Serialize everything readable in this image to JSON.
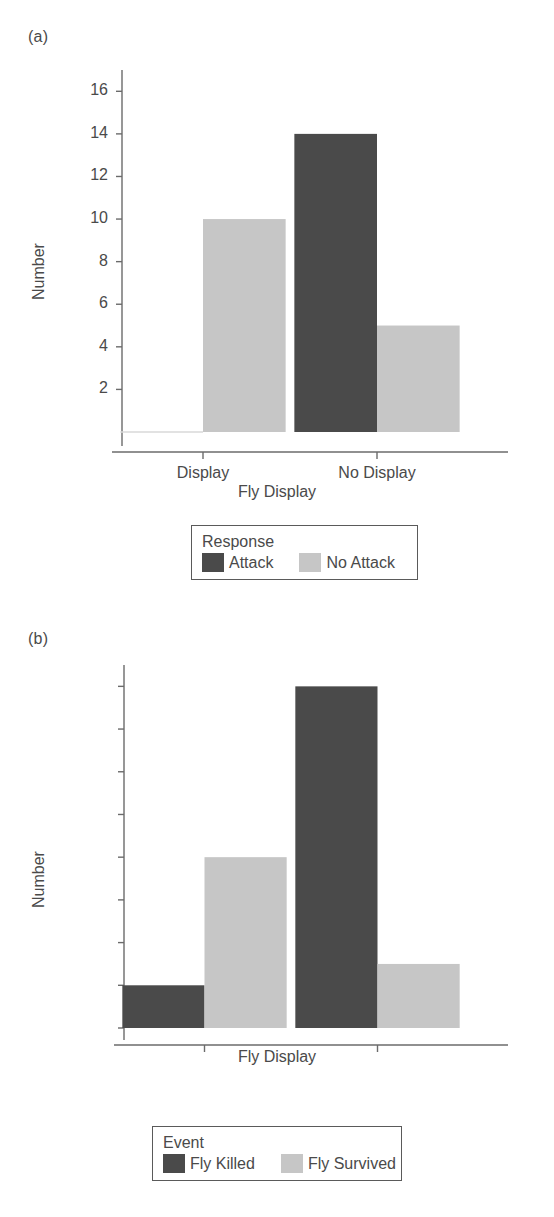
{
  "figure": {
    "background_color": "#ffffff",
    "text_color": "#4a4a4a",
    "dark_series_color": "#4a4a4a",
    "light_series_color": "#c6c6c6",
    "axis_color": "#6b6b6b"
  },
  "panels": [
    {
      "letter": "(a)",
      "legend_title": "Response",
      "legend_entries": [
        {
          "label": "Attack",
          "color": "#4a4a4a"
        },
        {
          "label": "No Attack",
          "color": "#c6c6c6"
        }
      ]
    },
    {
      "letter": "(b)",
      "legend_title": "Event",
      "legend_entries": [
        {
          "label": "Fly Killed",
          "color": "#4a4a4a"
        },
        {
          "label": "Fly Survived",
          "color": "#c6c6c6"
        }
      ]
    }
  ],
  "chart_data": [
    {
      "type": "bar",
      "panel": "(a)",
      "title": "",
      "xlabel": "Fly Display",
      "ylabel": "Number",
      "categories": [
        "Display",
        "No Display"
      ],
      "yticks": [
        2,
        4,
        6,
        8,
        10,
        12,
        14,
        16
      ],
      "ytick_labels": [
        "2",
        "4",
        "6",
        "8",
        "10",
        "12",
        "14",
        "16"
      ],
      "ylim": [
        0,
        17
      ],
      "grid": false,
      "legend_title": "Response",
      "legend_position": "below",
      "series": [
        {
          "name": "Attack",
          "color": "#4a4a4a",
          "values": [
            0,
            14
          ]
        },
        {
          "name": "No Attack",
          "color": "#c6c6c6",
          "values": [
            10,
            5
          ]
        }
      ]
    },
    {
      "type": "bar",
      "panel": "(b)",
      "title": "",
      "xlabel": "Fly Display",
      "ylabel": "Number",
      "categories": [
        "Display",
        "No Display"
      ],
      "yticks": [
        0,
        2,
        4,
        6,
        8,
        10,
        12,
        14,
        16
      ],
      "ytick_labels": [
        "0",
        "2",
        "4",
        "6",
        "8",
        "10",
        "12",
        "14",
        "16"
      ],
      "ylim": [
        0,
        17
      ],
      "grid": false,
      "legend_title": "Event",
      "legend_position": "below",
      "series": [
        {
          "name": "Fly Killed",
          "color": "#4a4a4a",
          "values": [
            2,
            16
          ]
        },
        {
          "name": "Fly Survived",
          "color": "#c6c6c6",
          "values": [
            8,
            3
          ]
        }
      ]
    }
  ]
}
